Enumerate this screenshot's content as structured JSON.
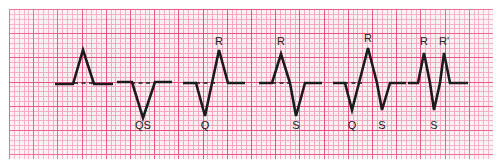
{
  "figure": {
    "paper": {
      "type": "ecg-graph-paper",
      "background_color": "#fdf0f3",
      "minor_grid_color": "#f4a8bf",
      "major_grid_color": "#e8517f",
      "minor_grid_px": 4.84,
      "major_grid_px": 24.2,
      "margin_color": "#ffffff"
    },
    "trace_color": "#1c1a1c",
    "baseline_y": 84
  },
  "chart_data": {
    "type": "line",
    "xlabel": "",
    "ylabel": "",
    "grid": true,
    "legend_position": "none",
    "baseline_y": 84,
    "series": [
      {
        "name": "complex-1-r-wave",
        "labels": [],
        "description": "Entirely positive deflection: single R wave, no Q, no S",
        "baseline_dash": {
          "x1": 74,
          "x2": 96
        },
        "points": [
          [
            55,
            84
          ],
          [
            73,
            84
          ],
          [
            83,
            50
          ],
          [
            94,
            84
          ],
          [
            113,
            84
          ]
        ]
      },
      {
        "name": "complex-2-qs-wave",
        "labels": [
          {
            "text": "QS",
            "x": 143,
            "y": 129,
            "position": "below"
          }
        ],
        "description": "Entirely negative deflection: QS wave",
        "baseline_dash": {
          "x1": 131,
          "x2": 155
        },
        "points": [
          [
            117,
            82
          ],
          [
            132,
            82
          ],
          [
            143,
            118
          ],
          [
            155,
            82
          ],
          [
            172,
            82
          ]
        ]
      },
      {
        "name": "complex-3-qr-wave",
        "labels": [
          {
            "text": "R",
            "x": 219,
            "y": 45,
            "position": "above"
          },
          {
            "text": "Q",
            "x": 205,
            "y": 129,
            "position": "below"
          }
        ],
        "description": "Initial negative Q wave followed by tall R wave",
        "baseline_dash": {
          "x1": 196,
          "x2": 216
        },
        "points": [
          [
            183,
            83
          ],
          [
            196,
            83
          ],
          [
            205,
            116
          ],
          [
            219,
            50
          ],
          [
            228,
            83
          ],
          [
            245,
            83
          ]
        ]
      },
      {
        "name": "complex-4-rs-wave",
        "labels": [
          {
            "text": "R",
            "x": 281,
            "y": 45,
            "position": "above"
          },
          {
            "text": "S",
            "x": 296,
            "y": 129,
            "position": "below"
          }
        ],
        "description": "R wave followed by negative S wave",
        "baseline_dash": {
          "x1": 272,
          "x2": 292
        },
        "points": [
          [
            259,
            83
          ],
          [
            272,
            83
          ],
          [
            281,
            54
          ],
          [
            290,
            83
          ],
          [
            296,
            116
          ],
          [
            305,
            83
          ],
          [
            322,
            83
          ]
        ]
      },
      {
        "name": "complex-5-qrs-wave",
        "labels": [
          {
            "text": "R",
            "x": 368,
            "y": 42,
            "position": "above"
          },
          {
            "text": "Q",
            "x": 352,
            "y": 129,
            "position": "below"
          },
          {
            "text": "S",
            "x": 382,
            "y": 129,
            "position": "below"
          }
        ],
        "description": "Q wave, tall R wave and S wave: full QRS complex",
        "baseline_dash": {
          "x1": 344,
          "x2": 362
        },
        "points": [
          [
            333,
            83
          ],
          [
            345,
            83
          ],
          [
            352,
            110
          ],
          [
            368,
            48
          ],
          [
            377,
            83
          ],
          [
            382,
            110
          ],
          [
            390,
            83
          ],
          [
            406,
            83
          ]
        ]
      },
      {
        "name": "complex-6-rsr-prime-wave",
        "labels": [
          {
            "text": "R",
            "x": 424,
            "y": 45,
            "position": "above"
          },
          {
            "text": "R'",
            "x": 444,
            "y": 45,
            "position": "above"
          },
          {
            "text": "S",
            "x": 434,
            "y": 129,
            "position": "below"
          }
        ],
        "description": "RSR' pattern: two positive deflections separated by an S wave",
        "baseline_dash": {
          "x1": 414,
          "x2": 421
        },
        "points": [
          [
            408,
            83
          ],
          [
            418,
            83
          ],
          [
            424,
            53
          ],
          [
            430,
            83
          ],
          [
            434,
            110
          ],
          [
            440,
            83
          ],
          [
            444,
            53
          ],
          [
            450,
            83
          ],
          [
            468,
            83
          ]
        ]
      }
    ]
  }
}
